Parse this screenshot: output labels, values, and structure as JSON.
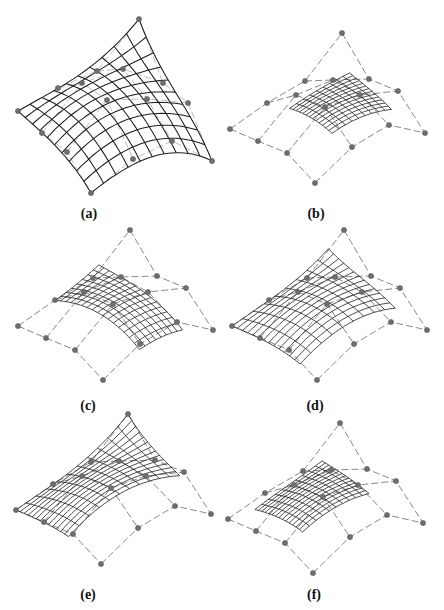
{
  "figure": {
    "colors": {
      "surface_mesh": "#1e1e1e",
      "control_net": "#7a7a7a",
      "control_point": "#6e6e6e",
      "background": "#ffffff"
    },
    "control_net_size": [
      4,
      4
    ],
    "panels": [
      {
        "id": "a",
        "label": "(a)",
        "net": "net_a",
        "u_range": [
          0.0,
          1.0
        ],
        "v_range": [
          0.0,
          1.0
        ],
        "u_lines": 11,
        "v_lines": 11,
        "show_net": false
      },
      {
        "id": "b",
        "label": "(b)",
        "net": "net_b",
        "u_range": [
          0.28,
          0.78
        ],
        "v_range": [
          0.32,
          0.86
        ],
        "u_lines": 14,
        "v_lines": 10,
        "show_net": true
      },
      {
        "id": "c",
        "label": "(c)",
        "net": "net_b",
        "u_range": [
          0.0,
          1.0
        ],
        "v_range": [
          0.33,
          0.72
        ],
        "u_lines": 17,
        "v_lines": 9,
        "show_net": true
      },
      {
        "id": "d",
        "label": "(d)",
        "net": "net_b",
        "u_range": [
          0.0,
          0.8
        ],
        "v_range": [
          0.0,
          0.86
        ],
        "u_lines": 14,
        "v_lines": 10,
        "show_net": true
      },
      {
        "id": "e",
        "label": "(e)",
        "net": "net_b",
        "u_range": [
          0.0,
          0.62
        ],
        "v_range": [
          0.0,
          1.0
        ],
        "u_lines": 14,
        "v_lines": 12,
        "show_net": true
      },
      {
        "id": "f",
        "label": "(f)",
        "net": "net_b",
        "u_range": [
          0.12,
          0.68
        ],
        "v_range": [
          0.15,
          0.75
        ],
        "u_lines": 15,
        "v_lines": 11,
        "show_net": true
      }
    ]
  }
}
